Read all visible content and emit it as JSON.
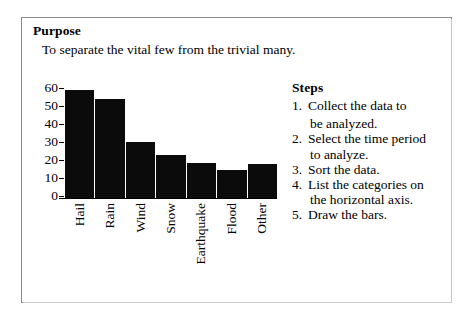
{
  "card": {
    "border_color": "#8b8b8b",
    "background": "#ffffff"
  },
  "purpose": {
    "heading": "Purpose",
    "text": "To separate the vital few from the trivial many."
  },
  "steps": {
    "heading": "Steps",
    "items": [
      {
        "number": "1.",
        "line1": "Collect the data to",
        "line2": "be analyzed."
      },
      {
        "number": "2.",
        "line1": "Select the time period",
        "line2": "to analyze."
      },
      {
        "number": "3.",
        "line1": "Sort the data.",
        "line2": ""
      },
      {
        "number": "4.",
        "line1": "List the categories on",
        "line2": "the horizontal axis."
      },
      {
        "number": "5.",
        "line1": "Draw the bars.",
        "line2": ""
      }
    ]
  },
  "chart_data": {
    "type": "bar",
    "title": "",
    "xlabel": "",
    "ylabel": "",
    "categories": [
      "Hail",
      "Rain",
      "Wind",
      "Snow",
      "Earthquake",
      "Flood",
      "Other"
    ],
    "values": [
      60,
      55,
      31,
      24,
      19.5,
      15.5,
      19
    ],
    "ylim": [
      0,
      60
    ],
    "yticks": [
      60,
      50,
      40,
      30,
      20,
      10,
      0
    ],
    "ytick_labels": [
      "60",
      "50",
      "40",
      "30",
      "20",
      "10",
      "0"
    ],
    "grid": false,
    "legend": "none",
    "bar_color": "#0b0b0b",
    "axis_color": "#000000",
    "xtick_rotation": -90
  }
}
